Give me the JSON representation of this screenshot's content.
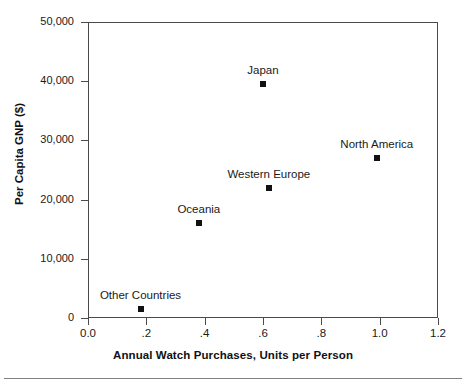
{
  "chart_data": {
    "type": "scatter",
    "title": "",
    "xlabel": "Annual Watch Purchases, Units per Person",
    "ylabel": "Per Capita GNP ($)",
    "xlim": [
      0.0,
      1.2
    ],
    "ylim": [
      0,
      50000
    ],
    "grid": false,
    "legend": "none",
    "xticks": [
      0.0,
      0.2,
      0.4,
      0.6,
      0.8,
      1.0,
      1.2
    ],
    "xtick_labels": [
      "0.0",
      ".2",
      ".4",
      ".6",
      ".8",
      "1.0",
      "1.2"
    ],
    "yticks": [
      0,
      10000,
      20000,
      30000,
      40000,
      50000
    ],
    "ytick_labels": [
      "0",
      "10,000",
      "20,000",
      "30,000",
      "40,000",
      "50,000"
    ],
    "marker_color": "#111111",
    "points": [
      {
        "label": "Other Countries",
        "x": 0.18,
        "y": 1500,
        "label_dx": 0,
        "label_dy": -20
      },
      {
        "label": "Oceania",
        "x": 0.38,
        "y": 16000,
        "label_dx": 0,
        "label_dy": -20
      },
      {
        "label": "Western Europe",
        "x": 0.62,
        "y": 22000,
        "label_dx": 0,
        "label_dy": -20
      },
      {
        "label": "Japan",
        "x": 0.6,
        "y": 39500,
        "label_dx": 0,
        "label_dy": -20
      },
      {
        "label": "North America",
        "x": 0.99,
        "y": 27000,
        "label_dx": 0,
        "label_dy": -20
      }
    ]
  },
  "axes": {
    "x_title": "Annual Watch Purchases, Units per Person",
    "y_title": "Per Capita GNP ($)"
  }
}
